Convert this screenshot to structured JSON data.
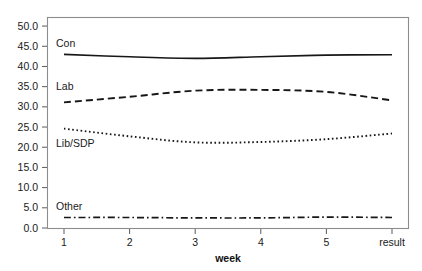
{
  "chart_data": {
    "type": "line",
    "title": "",
    "xlabel": "week",
    "ylabel": "",
    "x": [
      1,
      2,
      3,
      4,
      5,
      6
    ],
    "categories": [
      "1",
      "2",
      "3",
      "4",
      "5",
      "result"
    ],
    "xtick_labels": [
      "1",
      "2",
      "3",
      "4",
      "5",
      "result"
    ],
    "ytick_labels": [
      "0.0",
      "5.0",
      "10.0",
      "15.0",
      "20.0",
      "25.0",
      "30.0",
      "35.0",
      "40.0",
      "45.0",
      "50.0"
    ],
    "ylim": [
      0.0,
      52.0
    ],
    "ytick_values": [
      0.0,
      5.0,
      10.0,
      15.0,
      20.0,
      25.0,
      30.0,
      35.0,
      40.0,
      45.0,
      50.0
    ],
    "grid": false,
    "legend": "inline-labels",
    "legend_position": "inside-plot-left",
    "series": [
      {
        "name": "Con",
        "label": "Con",
        "linestyle": "solid",
        "dasharray": "",
        "width": 1.6,
        "values": [
          43.0,
          42.4,
          42.0,
          42.4,
          42.8,
          42.9
        ]
      },
      {
        "name": "Lab",
        "label": "Lab",
        "linestyle": "dashed",
        "dasharray": "7,4",
        "width": 1.9,
        "values": [
          31.1,
          32.5,
          34.0,
          34.2,
          33.7,
          31.6
        ]
      },
      {
        "name": "Lib/SDP",
        "label": "Lib/SDP",
        "linestyle": "dotted",
        "dasharray": "1.6,2.6",
        "width": 1.9,
        "values": [
          24.6,
          22.7,
          21.2,
          21.3,
          22.0,
          23.4
        ]
      },
      {
        "name": "Other",
        "label": "Other",
        "linestyle": "dashdot",
        "dasharray": "7,3,1.6,3",
        "width": 1.7,
        "values": [
          2.6,
          2.6,
          2.5,
          2.5,
          2.7,
          2.6
        ]
      }
    ],
    "annotations": [
      {
        "text": "Con",
        "x": 1.0,
        "y": 45.6
      },
      {
        "text": "Lab",
        "x": 1.0,
        "y": 35.0
      },
      {
        "text": "Lib/SDP",
        "x": 1.0,
        "y": 21.0
      },
      {
        "text": "Other",
        "x": 1.0,
        "y": 5.4
      }
    ]
  },
  "caption": ""
}
